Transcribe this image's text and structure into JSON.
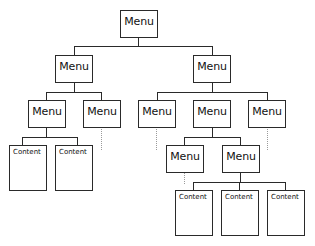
{
  "diagram": {
    "type": "hierarchical-tree",
    "nodes": {
      "root": "Menu",
      "l2_left": "Menu",
      "l2_right": "Menu",
      "l3_1": "Menu",
      "l3_2": "Menu",
      "l3_3": "Menu",
      "l3_4": "Menu",
      "l3_5": "Menu",
      "l4_1": "Menu",
      "l4_2": "Menu",
      "c_1": "Content",
      "c_2": "Content",
      "c_3": "Content",
      "c_4": "Content",
      "c_5": "Content"
    },
    "colors": {
      "stroke": "#2a2a2a",
      "dotted": "#9a9a9a",
      "background": "#ffffff"
    }
  }
}
